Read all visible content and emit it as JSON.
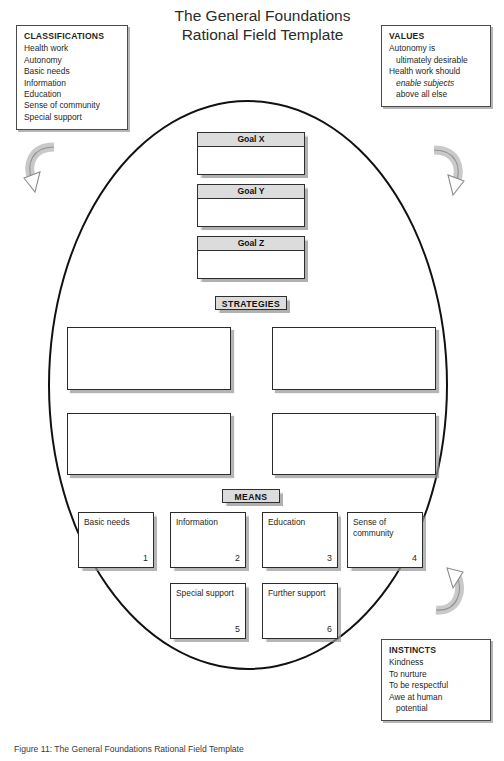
{
  "figure": {
    "title_lines": [
      "The General Foundations",
      "Rational Field Template"
    ],
    "caption": "Figure 11: The General Foundations Rational Field Template"
  },
  "notes": {
    "classifications": {
      "heading": "CLASSIFICATIONS",
      "items": [
        "Health work",
        "Autonomy",
        "Basic needs",
        "Information",
        "Education",
        "Sense of community",
        "Special support"
      ]
    },
    "values": {
      "heading": "VALUES",
      "lines": [
        {
          "text": "Autonomy is",
          "indent": false
        },
        {
          "text": "ultimately desirable",
          "indent": true
        },
        {
          "text": "Health work should",
          "indent": false
        },
        {
          "text": "enable subjects",
          "indent": true,
          "italic": true
        },
        {
          "text": "above all else",
          "indent": true
        }
      ]
    },
    "instincts": {
      "heading": "INSTINCTS",
      "lines": [
        {
          "text": "Kindness",
          "indent": false
        },
        {
          "text": "To nurture",
          "indent": false
        },
        {
          "text": "To be respectful",
          "indent": false
        },
        {
          "text": "Awe at human",
          "indent": false
        },
        {
          "text": "potential",
          "indent": true
        }
      ]
    }
  },
  "goals": [
    {
      "label": "Goal X",
      "body": ""
    },
    {
      "label": "Goal Y",
      "body": ""
    },
    {
      "label": "Goal Z",
      "body": ""
    }
  ],
  "sections": {
    "strategies_label": "STRATEGIES",
    "means_label": "MEANS"
  },
  "strategies": [
    {
      "text": ""
    },
    {
      "text": ""
    },
    {
      "text": ""
    },
    {
      "text": ""
    }
  ],
  "means": [
    {
      "label": "Basic needs",
      "number": "1"
    },
    {
      "label": "Information",
      "number": "2"
    },
    {
      "label": "Education",
      "number": "3"
    },
    {
      "label": "Sense of\ncommunity",
      "number": "4"
    },
    {
      "label": "Special\nsupport",
      "number": "5"
    },
    {
      "label": "Further\nsupport",
      "number": "6"
    }
  ],
  "arrows": [
    {
      "name": "top-left-curved-arrow"
    },
    {
      "name": "top-right-curved-arrow"
    },
    {
      "name": "bottom-right-curved-arrow"
    }
  ],
  "colors": {
    "chip_fill": "#dcdcdc",
    "outline": "#2b2b2b",
    "ellipse": "#111111",
    "arrow_fill": "#d0d0d0",
    "arrow_stroke": "#8f8f8f"
  }
}
